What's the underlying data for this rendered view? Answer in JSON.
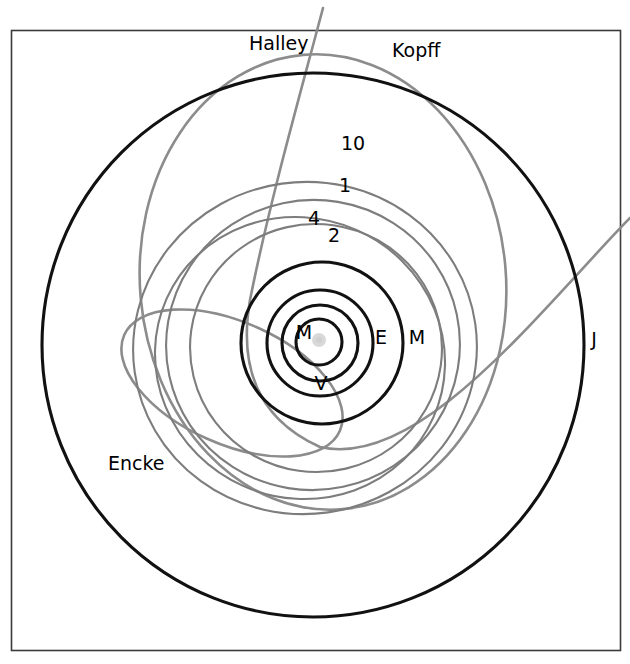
{
  "figure": {
    "background_color": "#ffffff",
    "frame": {
      "stroke_color": "#3b3b3b",
      "x": 11,
      "y": 30,
      "width": 609,
      "height": 620
    },
    "sun": {
      "label": "sun",
      "color": "#d8d8d8",
      "cx": 319,
      "cy": 340,
      "r": 7
    },
    "colors": {
      "planet_orbit": "#111111",
      "minor_body_orbit": "#7d7d7d",
      "comet_orbit": "#8c8c8c",
      "label_text": "#000000"
    },
    "labels": [
      {
        "id": "halley",
        "text": "Halley",
        "x": 249,
        "y": 50,
        "anchor": "start",
        "size": 19
      },
      {
        "id": "kopff",
        "text": "Kopff",
        "x": 392,
        "y": 57,
        "anchor": "start",
        "size": 19
      },
      {
        "id": "hygiea",
        "text": "10",
        "x": 353,
        "y": 150,
        "anchor": "middle",
        "size": 19
      },
      {
        "id": "ceres",
        "text": "1",
        "x": 345,
        "y": 192,
        "anchor": "middle",
        "size": 19
      },
      {
        "id": "vesta",
        "text": "4",
        "x": 314,
        "y": 225,
        "anchor": "middle",
        "size": 19
      },
      {
        "id": "pallas",
        "text": "2",
        "x": 334,
        "y": 242,
        "anchor": "middle",
        "size": 19
      },
      {
        "id": "mercury",
        "text": "M",
        "x": 304,
        "y": 339,
        "anchor": "middle",
        "size": 19
      },
      {
        "id": "venus",
        "text": "V",
        "x": 321,
        "y": 390,
        "anchor": "middle",
        "size": 19
      },
      {
        "id": "earth",
        "text": "E",
        "x": 381,
        "y": 344,
        "anchor": "middle",
        "size": 19
      },
      {
        "id": "mars",
        "text": "M",
        "x": 417,
        "y": 344,
        "anchor": "middle",
        "size": 19
      },
      {
        "id": "jupiter",
        "text": "J",
        "x": 594,
        "y": 346,
        "anchor": "middle",
        "size": 19
      },
      {
        "id": "encke",
        "text": "Encke",
        "x": 108,
        "y": 470,
        "anchor": "start",
        "size": 19
      }
    ]
  },
  "chart_data": {
    "type": "scatter",
    "xlabel": "",
    "ylabel": "",
    "projection": "ecliptic plane, Sun at focus",
    "grid": false,
    "legend_position": "inline-labels",
    "units": "AU",
    "scale_px_per_au": 52.0,
    "sun_pixel": {
      "x": 319,
      "y": 340
    },
    "series": [
      {
        "name": "Mercury",
        "label": "M",
        "group": "planet",
        "color": "#111111",
        "semi_major_au": 0.39,
        "eccentricity": 0.206,
        "orbit_px": {
          "cx": 319,
          "cy": 342,
          "rx": 23,
          "ry": 23,
          "rotation": 0
        }
      },
      {
        "name": "Venus",
        "label": "V",
        "group": "planet",
        "color": "#111111",
        "semi_major_au": 0.72,
        "eccentricity": 0.007,
        "orbit_px": {
          "cx": 320,
          "cy": 343,
          "rx": 38,
          "ry": 38,
          "rotation": 0
        }
      },
      {
        "name": "Earth",
        "label": "E",
        "group": "planet",
        "color": "#111111",
        "semi_major_au": 1.0,
        "eccentricity": 0.017,
        "orbit_px": {
          "cx": 320,
          "cy": 343,
          "rx": 53,
          "ry": 53,
          "rotation": 0
        }
      },
      {
        "name": "Mars",
        "label": "M",
        "group": "planet",
        "color": "#111111",
        "semi_major_au": 1.52,
        "eccentricity": 0.093,
        "orbit_px": {
          "cx": 322,
          "cy": 343,
          "rx": 81,
          "ry": 81,
          "rotation": 0
        }
      },
      {
        "name": "Jupiter",
        "label": "J",
        "group": "planet",
        "color": "#111111",
        "semi_major_au": 5.2,
        "eccentricity": 0.049,
        "orbit_px": {
          "cx": 313,
          "cy": 345,
          "rx": 271,
          "ry": 272,
          "rotation": 0
        }
      },
      {
        "name": "Ceres",
        "label": "1",
        "group": "asteroid",
        "color": "#7d7d7d",
        "semi_major_au": 2.77,
        "eccentricity": 0.076,
        "orbit_px": {
          "cx": 313,
          "cy": 345,
          "rx": 147,
          "ry": 145,
          "rotation": -12
        }
      },
      {
        "name": "Pallas",
        "label": "2",
        "group": "asteroid",
        "color": "#7d7d7d",
        "semi_major_au": 2.77,
        "eccentricity": 0.231,
        "orbit_px": {
          "cx": 300,
          "cy": 358,
          "rx": 146,
          "ry": 140,
          "rotation": 24
        }
      },
      {
        "name": "Vesta",
        "label": "4",
        "group": "asteroid",
        "color": "#7d7d7d",
        "semi_major_au": 2.36,
        "eccentricity": 0.089,
        "orbit_px": {
          "cx": 316,
          "cy": 348,
          "rx": 126,
          "ry": 124,
          "rotation": 8
        }
      },
      {
        "name": "Hygiea",
        "label": "10",
        "group": "asteroid",
        "color": "#7d7d7d",
        "semi_major_au": 3.14,
        "eccentricity": 0.112,
        "orbit_px": {
          "cx": 305,
          "cy": 348,
          "rx": 172,
          "ry": 166,
          "rotation": -8
        }
      },
      {
        "name": "Encke",
        "label": "Encke",
        "group": "comet",
        "color": "#8c8c8c",
        "semi_major_au": 2.22,
        "eccentricity": 0.848,
        "perihelion_au": 0.34,
        "aphelion_au": 4.1,
        "orbit_px": {
          "cx": 232,
          "cy": 383,
          "rx": 118,
          "ry": 61,
          "rotation": 24
        }
      },
      {
        "name": "Kopff",
        "label": "Kopff",
        "group": "comet",
        "color": "#8c8c8c",
        "semi_major_au": 3.46,
        "eccentricity": 0.544,
        "perihelion_au": 1.58,
        "aphelion_au": 5.34,
        "orbit_px": {
          "cx": 323,
          "cy": 282,
          "rx": 183,
          "ry": 228,
          "rotation": -5
        }
      },
      {
        "name": "Halley",
        "label": "Halley",
        "group": "comet",
        "color": "#8c8c8c",
        "semi_major_au": 17.8,
        "eccentricity": 0.967,
        "perihelion_au": 0.586,
        "note": "open arc, extends beyond the frame",
        "path_px": "M 323,8 C 300,95 270,200 250,300 C 238,370 260,420 320,447 C 420,470 540,310 630,218"
      }
    ]
  }
}
